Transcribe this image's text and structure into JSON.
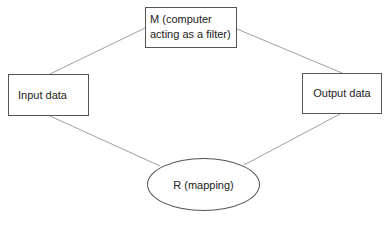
{
  "diagram": {
    "nodes": {
      "m": {
        "line1": "M (computer",
        "line2": "acting as a filter)",
        "shape": "rectangle"
      },
      "input": {
        "label": "Input data",
        "shape": "rectangle"
      },
      "output": {
        "label": "Output data",
        "shape": "rectangle"
      },
      "r": {
        "label": "R (mapping)",
        "shape": "ellipse"
      }
    },
    "edges": [
      {
        "from": "input",
        "to": "m"
      },
      {
        "from": "m",
        "to": "output"
      },
      {
        "from": "input",
        "to": "r"
      },
      {
        "from": "r",
        "to": "output"
      }
    ],
    "colors": {
      "line": "#9a9a9a",
      "border": "#555555",
      "text": "#222222",
      "background": "#ffffff"
    }
  }
}
